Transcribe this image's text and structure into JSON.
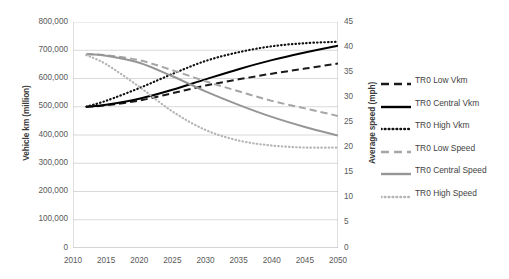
{
  "chart_data": {
    "type": "line",
    "title": "",
    "xlabel": "",
    "ylabel": "Vehicle km (million)",
    "y2label": "Average speed (mph)",
    "x": [
      2012,
      2015,
      2020,
      2025,
      2030,
      2035,
      2040,
      2045,
      2050
    ],
    "xlim": [
      2010,
      2050
    ],
    "ylim": [
      0,
      800000
    ],
    "y2lim": [
      0,
      45
    ],
    "xticks": [
      "2010",
      "2015",
      "2020",
      "2025",
      "2030",
      "2035",
      "2040",
      "2045",
      "2050"
    ],
    "yticks": [
      "0",
      "100,000",
      "200,000",
      "300,000",
      "400,000",
      "500,000",
      "600,000",
      "700,000",
      "800,000"
    ],
    "y2ticks": [
      "0",
      "5",
      "10",
      "15",
      "20",
      "25",
      "30",
      "35",
      "40",
      "45"
    ],
    "grid": true,
    "legend_position": "right",
    "series": [
      {
        "name": "TR0 Low Vkm",
        "axis": "left",
        "color": "#1a1a1a",
        "style": "dashed",
        "values": [
          500000,
          505000,
          522000,
          548000,
          575000,
          597000,
          617000,
          635000,
          653000
        ]
      },
      {
        "name": "TR0 Central Vkm",
        "axis": "left",
        "color": "#000000",
        "style": "solid",
        "values": [
          500000,
          507000,
          528000,
          560000,
          597000,
          633000,
          665000,
          692000,
          716000
        ]
      },
      {
        "name": "TR0 High Vkm",
        "axis": "left",
        "color": "#111111",
        "style": "dotted",
        "values": [
          500000,
          521000,
          566000,
          616000,
          662000,
          693000,
          714000,
          725000,
          730000
        ]
      },
      {
        "name": "TR0 Low Speed",
        "axis": "right",
        "color": "#a6a6a6",
        "style": "dashed",
        "values": [
          38.6,
          38.4,
          37.4,
          35.4,
          33.2,
          31.2,
          29.3,
          27.8,
          26.3
        ]
      },
      {
        "name": "TR0 Central Speed",
        "axis": "right",
        "color": "#969696",
        "style": "solid",
        "values": [
          38.6,
          38.3,
          36.9,
          34.2,
          31.2,
          28.5,
          26.1,
          24.1,
          22.4
        ]
      },
      {
        "name": "TR0 High Speed",
        "axis": "right",
        "color": "#b5b5b5",
        "style": "dotted",
        "values": [
          38.4,
          36.6,
          32.1,
          27.2,
          23.5,
          21.4,
          20.4,
          20.0,
          20.0
        ]
      }
    ]
  },
  "legend": {
    "items": [
      {
        "label": "TR0 Low Vkm"
      },
      {
        "label": "TR0 Central Vkm"
      },
      {
        "label": "TR0 High Vkm"
      },
      {
        "label": "TR0 Low Speed"
      },
      {
        "label": "TR0 Central Speed"
      },
      {
        "label": "TR0 High Speed"
      }
    ]
  },
  "colors": {
    "black": "#000000",
    "gray": "#9a9a9a",
    "grid": "#d9d9d9",
    "axis": "#bfbfbf",
    "text": "#3f3f3f"
  }
}
